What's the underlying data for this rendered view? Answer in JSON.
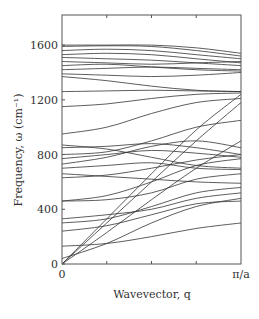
{
  "chart_data": {
    "type": "line",
    "title": "",
    "xlabel": "Wavevector, q",
    "ylabel": "Frequency, ω (cm⁻¹)",
    "x_ticks": [
      "0",
      "π/a"
    ],
    "y_ticks": [
      "0",
      "400",
      "800",
      "1200",
      "1600"
    ],
    "xlim": [
      0,
      1
    ],
    "ylim": [
      0,
      1820
    ],
    "grid": false,
    "legend": null,
    "x": [
      0,
      0.25,
      0.5,
      0.75,
      1.0
    ],
    "series": [
      {
        "name": "acoustic-1",
        "values": [
          0,
          230,
          470,
          700,
          900
        ]
      },
      {
        "name": "acoustic-2",
        "values": [
          0,
          300,
          600,
          900,
          1180
        ]
      },
      {
        "name": "acoustic-3",
        "values": [
          0,
          330,
          660,
          980,
          1240
        ]
      },
      {
        "name": "band-4",
        "values": [
          40,
          150,
          300,
          420,
          480
        ]
      },
      {
        "name": "band-5",
        "values": [
          130,
          150,
          200,
          260,
          300
        ]
      },
      {
        "name": "band-6",
        "values": [
          240,
          280,
          360,
          440,
          460
        ]
      },
      {
        "name": "band-7",
        "values": [
          300,
          330,
          420,
          520,
          560
        ]
      },
      {
        "name": "band-8",
        "values": [
          330,
          360,
          400,
          480,
          520
        ]
      },
      {
        "name": "band-9",
        "values": [
          460,
          470,
          520,
          620,
          660
        ]
      },
      {
        "name": "band-10",
        "values": [
          460,
          500,
          600,
          720,
          770
        ]
      },
      {
        "name": "band-11",
        "values": [
          630,
          650,
          700,
          760,
          800
        ]
      },
      {
        "name": "band-12",
        "values": [
          660,
          640,
          620,
          600,
          590
        ]
      },
      {
        "name": "band-13",
        "values": [
          700,
          720,
          740,
          700,
          690
        ]
      },
      {
        "name": "band-14",
        "values": [
          730,
          780,
          860,
          900,
          850
        ]
      },
      {
        "name": "band-15",
        "values": [
          770,
          800,
          830,
          810,
          780
        ]
      },
      {
        "name": "band-16",
        "values": [
          800,
          820,
          900,
          1000,
          1050
        ]
      },
      {
        "name": "band-17",
        "values": [
          850,
          860,
          880,
          850,
          800
        ]
      },
      {
        "name": "band-18",
        "values": [
          870,
          840,
          780,
          720,
          700
        ]
      },
      {
        "name": "band-19",
        "values": [
          950,
          1000,
          1100,
          1180,
          1210
        ]
      },
      {
        "name": "band-20",
        "values": [
          1150,
          1170,
          1210,
          1240,
          1250
        ]
      },
      {
        "name": "band-21",
        "values": [
          1260,
          1265,
          1270,
          1265,
          1260
        ]
      },
      {
        "name": "band-22",
        "values": [
          1370,
          1340,
          1300,
          1270,
          1260
        ]
      },
      {
        "name": "band-23",
        "values": [
          1390,
          1380,
          1370,
          1380,
          1400
        ]
      },
      {
        "name": "band-24",
        "values": [
          1420,
          1430,
          1440,
          1430,
          1420
        ]
      },
      {
        "name": "band-25",
        "values": [
          1450,
          1460,
          1440,
          1420,
          1410
        ]
      },
      {
        "name": "band-26",
        "values": [
          1480,
          1470,
          1460,
          1470,
          1480
        ]
      },
      {
        "name": "band-27",
        "values": [
          1510,
          1500,
          1490,
          1470,
          1450
        ]
      },
      {
        "name": "band-28",
        "values": [
          1530,
          1540,
          1530,
          1500,
          1470
        ]
      },
      {
        "name": "band-29",
        "values": [
          1560,
          1570,
          1560,
          1530,
          1500
        ]
      },
      {
        "name": "band-30",
        "values": [
          1590,
          1595,
          1590,
          1560,
          1520
        ]
      },
      {
        "name": "band-31",
        "values": [
          1600,
          1600,
          1600,
          1580,
          1540
        ]
      }
    ]
  }
}
